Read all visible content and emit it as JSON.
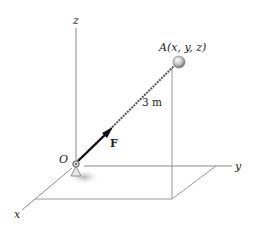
{
  "diagram": {
    "type": "3d-vector-figure",
    "labels": {
      "z_axis": "z",
      "y_axis": "y",
      "x_axis": "x",
      "origin": "O",
      "point_a": "A(x, y, z)",
      "force": "F",
      "length": "3 m"
    },
    "colors": {
      "axis": "#8a8a8a",
      "rod": "#555555",
      "force_arrow": "#111111",
      "ball": "#bdbdbd",
      "shadow": "#cfcfcf"
    }
  }
}
